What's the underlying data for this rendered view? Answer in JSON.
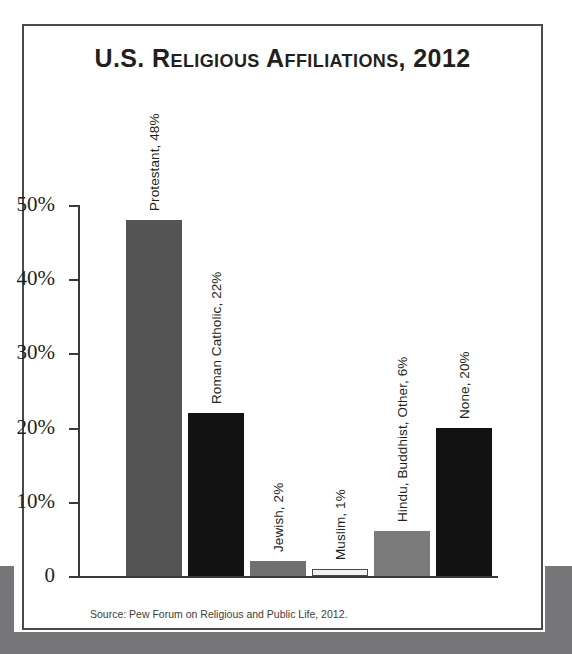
{
  "figure": {
    "title": "U.S. Religious Affiliations, 2012",
    "source": "Source: Pew Forum on Religious and Public Life, 2012."
  },
  "chart_data": {
    "type": "bar",
    "title": "U.S. Religious Affiliations, 2012",
    "xlabel": "",
    "ylabel": "",
    "ylim": [
      0,
      50
    ],
    "grid": false,
    "legend": null,
    "ytick_labels": [
      "0",
      "10%",
      "20%",
      "30%",
      "40%",
      "50%"
    ],
    "ytick_values": [
      0,
      10,
      20,
      30,
      40,
      50
    ],
    "categories": [
      "Protestant",
      "Roman Catholic",
      "Jewish",
      "Muslim",
      "Hindu, Buddhist, Other",
      "None"
    ],
    "values": [
      48,
      22,
      2,
      1,
      6,
      20
    ],
    "data_labels": [
      "Protestant, 48%",
      "Roman Catholic, 22%",
      "Jewish, 2%",
      "Muslim, 1%",
      "Hindu, Buddhist, Other, 6%",
      "None, 20%"
    ],
    "bar_colors": [
      "#545454",
      "#121212",
      "#6f6f6f",
      "#f2f2f2",
      "#7b7b7b",
      "#121212"
    ],
    "bar_border_colors": [
      "#545454",
      "#121212",
      "#6f6f6f",
      "#4a4a4a",
      "#7b7b7b",
      "#121212"
    ],
    "annotation_rotation": -90
  },
  "colors": {
    "axis": "#3a3a3a",
    "text": "#231f20",
    "frame": "#4a4a4a",
    "page_background": "#77777a",
    "card_background": "#ffffff"
  }
}
